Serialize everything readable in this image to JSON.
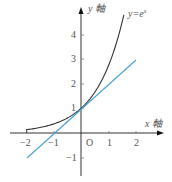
{
  "chart_data": {
    "type": "line",
    "title": "",
    "xlabel": "x 軸",
    "ylabel": "y 軸",
    "xlim": [
      -2.5,
      2.9
    ],
    "ylim": [
      -1.7,
      5.0
    ],
    "x_ticks": [
      -2,
      -1,
      1,
      2
    ],
    "y_ticks": [
      -1,
      1,
      2,
      3,
      4
    ],
    "origin_label": "O",
    "grid": false,
    "legend": null,
    "annotations": [
      {
        "text": "y=e^x",
        "x": 1.6,
        "y": 4.8,
        "attached_to": "y=e^x"
      }
    ],
    "series": [
      {
        "name": "y=e^x",
        "color": "#333333",
        "function": "exp(x)",
        "x": [
          -2,
          -1.5,
          -1,
          -0.5,
          0,
          0.5,
          1,
          1.25,
          1.5,
          1.57
        ],
        "y": [
          0.135,
          0.223,
          0.368,
          0.607,
          1,
          1.649,
          2.718,
          3.49,
          4.48,
          4.8
        ]
      },
      {
        "name": "y=x+1 (tangent at x=0)",
        "color": "#4ba3d6",
        "function": "x+1",
        "x": [
          -2,
          -1,
          0,
          1,
          2
        ],
        "y": [
          -1,
          0,
          1,
          2,
          3
        ]
      }
    ]
  },
  "labels": {
    "y_axis": "y 軸",
    "x_axis": "x 軸",
    "origin": "O",
    "curve": "y=e",
    "curve_sup": "x",
    "xt_m2": "−2",
    "xt_m1": "−1",
    "xt_1": "1",
    "xt_2": "2",
    "yt_4": "4",
    "yt_3": "3",
    "yt_2": "2",
    "yt_1": "1",
    "yt_m1": "−1"
  }
}
